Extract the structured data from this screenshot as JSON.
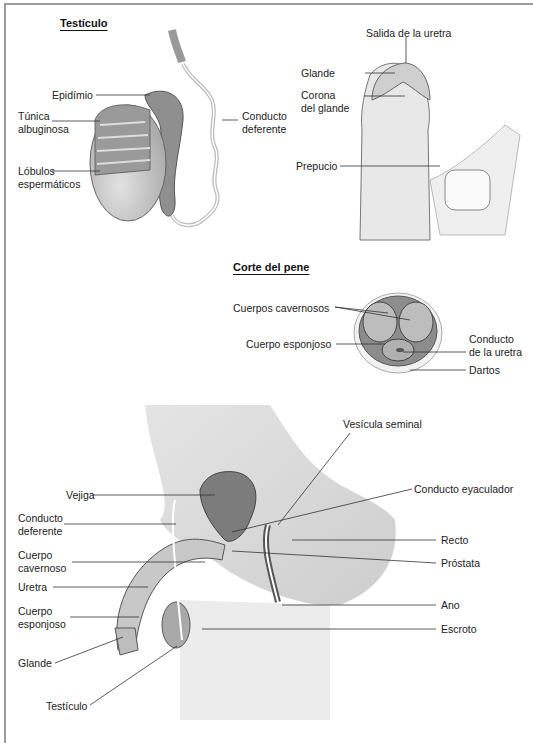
{
  "panels": {
    "testicle": {
      "title": "Testículo",
      "labels": {
        "epididymis": "Epidímio",
        "tunica_l1": "Túnica",
        "tunica_l2": "albuginosa",
        "lobules_l1": "Lóbulos",
        "lobules_l2": "espermáticos",
        "vas_l1": "Conducto",
        "vas_l2": "deferente"
      }
    },
    "penis_external": {
      "labels": {
        "urethral_opening": "Salida de la uretra",
        "glans": "Glande",
        "corona_l1": "Corona",
        "corona_l2": "del glande",
        "foreskin": "Prepucio"
      }
    },
    "penis_section": {
      "title": "Corte del pene",
      "labels": {
        "cavernous": "Cuerpos cavernosos",
        "spongy": "Cuerpo esponjoso",
        "urethra_l1": "Conducto",
        "urethra_l2": "de la uretra",
        "dartos": "Dartos"
      }
    },
    "sagittal": {
      "labels": {
        "seminal_vesicle": "Vesícula seminal",
        "bladder": "Vejiga",
        "vas_l1": "Conducto",
        "vas_l2": "deferente",
        "ejaculatory_duct": "Conducto eyaculador",
        "corpus_cav_l1": "Cuerpo",
        "corpus_cav_l2": "cavernoso",
        "rectum": "Recto",
        "prostate": "Próstata",
        "urethra": "Uretra",
        "corpus_spong_l1": "Cuerpo",
        "corpus_spong_l2": "esponjoso",
        "anus": "Ano",
        "scrotum": "Escroto",
        "glans": "Glande",
        "testicle": "Testículo"
      }
    }
  }
}
